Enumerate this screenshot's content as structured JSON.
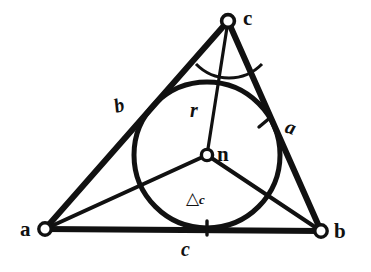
{
  "figure": {
    "background_color": "#ffffff",
    "ink_color": "#111111"
  },
  "vertices": [
    {
      "name": "vertex-a",
      "label": "a",
      "x": 45,
      "y": 229,
      "label_x": 20,
      "label_y": 219,
      "marker": "open-circle"
    },
    {
      "name": "vertex-b",
      "label": "b",
      "x": 321,
      "y": 231,
      "label_x": 334,
      "label_y": 221,
      "marker": "open-circle"
    },
    {
      "name": "vertex-c",
      "label": "c",
      "x": 228,
      "y": 21,
      "label_x": 243,
      "label_y": 8,
      "marker": "open-circle"
    }
  ],
  "incenter": {
    "name": "incenter-n",
    "label": "n",
    "x": 207,
    "y": 155,
    "label_x": 217,
    "label_y": 144,
    "marker": "open-circle"
  },
  "incircle": {
    "center_x": 207,
    "center_y": 155,
    "radius": 73
  },
  "side_labels": [
    {
      "name": "side-label-b",
      "label": "b",
      "x": 114,
      "y": 95,
      "style": "italic-slanted"
    },
    {
      "name": "side-label-a",
      "label": "a",
      "x": 286,
      "y": 117,
      "style": "italic-slanted-right"
    },
    {
      "name": "side-label-c",
      "label": "c",
      "x": 181,
      "y": 239,
      "style": "italic"
    }
  ],
  "radius_label": {
    "name": "radius-label-r",
    "label": "r",
    "x": 190,
    "y": 100
  },
  "area_label": {
    "name": "area-label-delta-c",
    "symbol": "△",
    "subscript": "c",
    "x": 186,
    "y": 190
  },
  "tick_marks": [
    {
      "name": "tangent-tick-side-b",
      "x": 152,
      "y": 107
    },
    {
      "name": "tangent-tick-side-a",
      "x": 265,
      "y": 122
    },
    {
      "name": "tangent-tick-side-c",
      "x": 207,
      "y": 228
    }
  ],
  "angle_arc": {
    "name": "angle-arc-at-c",
    "vertex_x": 228,
    "vertex_y": 21,
    "radius": 46
  },
  "bisectors": [
    {
      "name": "bisector-from-a",
      "from": "a",
      "to": "n"
    },
    {
      "name": "bisector-from-b",
      "from": "b",
      "to": "n"
    },
    {
      "name": "bisector-from-c",
      "from": "c",
      "to": "n"
    }
  ],
  "sides": [
    {
      "name": "side-ab",
      "from": "a",
      "to": "b",
      "label": "c"
    },
    {
      "name": "side-ac",
      "from": "a",
      "to": "c",
      "label": "b"
    },
    {
      "name": "side-bc",
      "from": "b",
      "to": "c",
      "label": "a"
    }
  ]
}
